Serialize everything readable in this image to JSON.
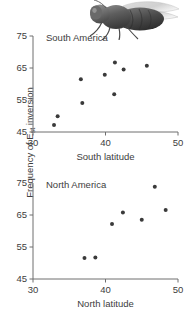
{
  "figure": {
    "ylabel_prefix": "Frequency of E",
    "ylabel_sub": "st",
    "ylabel_suffix": " inversion",
    "illustration": "fruit-fly-photo"
  },
  "chart_data": [
    {
      "type": "scatter",
      "title": "South America",
      "xlabel": "South latitude",
      "ylabel": "Frequency of Est inversion",
      "xlim": [
        30,
        50
      ],
      "ylim": [
        45,
        75
      ],
      "xticks": [
        30,
        40,
        50
      ],
      "yticks": [
        45,
        55,
        65,
        75
      ],
      "grid": false,
      "legend": "none",
      "marker_color": "#3a3a3a",
      "points": [
        {
          "x": 32.9,
          "y": 47.2
        },
        {
          "x": 33.4,
          "y": 49.9
        },
        {
          "x": 36.8,
          "y": 54.1
        },
        {
          "x": 36.6,
          "y": 61.5
        },
        {
          "x": 39.9,
          "y": 62.9
        },
        {
          "x": 41.2,
          "y": 56.8
        },
        {
          "x": 41.3,
          "y": 66.7
        },
        {
          "x": 42.5,
          "y": 64.5
        },
        {
          "x": 45.7,
          "y": 65.7
        }
      ]
    },
    {
      "type": "scatter",
      "title": "North America",
      "xlabel": "North latitude",
      "ylabel": "Frequency of Est inversion",
      "xlim": [
        30,
        50
      ],
      "ylim": [
        45,
        75
      ],
      "xticks": [
        30,
        40,
        50
      ],
      "yticks": [
        45,
        55,
        65,
        75
      ],
      "grid": false,
      "legend": "none",
      "marker_color": "#3a3a3a",
      "points": [
        {
          "x": 37.1,
          "y": 51.6
        },
        {
          "x": 38.6,
          "y": 51.7
        },
        {
          "x": 40.9,
          "y": 62.2
        },
        {
          "x": 42.4,
          "y": 65.8
        },
        {
          "x": 45.0,
          "y": 63.5
        },
        {
          "x": 46.8,
          "y": 73.8
        },
        {
          "x": 48.3,
          "y": 66.6
        }
      ]
    }
  ]
}
